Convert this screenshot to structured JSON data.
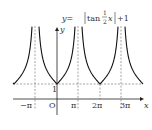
{
  "chart_data": {
    "type": "line",
    "title_parts": {
      "lhs": "y=",
      "fn": "tan",
      "frac_num": "1",
      "frac_den": "2",
      "var": "x",
      "tail": "+1"
    },
    "xlabel": "x",
    "ylabel": "y",
    "origin_label": "O",
    "x_ticks": [
      "−π",
      "π",
      "2π",
      "3π"
    ],
    "y_ticks": [
      "1"
    ],
    "asymptotes": [
      "−π",
      "π",
      "3π"
    ],
    "minima": [
      {
        "x": "0",
        "y": 1
      },
      {
        "x": "2π",
        "y": 1
      }
    ],
    "xlim": [
      "-3π/2",
      "7π/2"
    ],
    "series": [
      {
        "name": "y=|tan(x/2)|+1",
        "period": "2π"
      }
    ],
    "grid": false
  }
}
